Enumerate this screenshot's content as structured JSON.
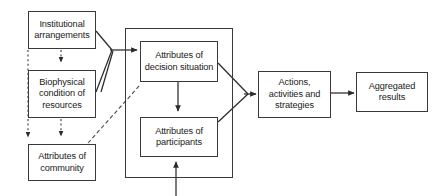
{
  "diagram": {
    "stroke_color": "#3a3a3a",
    "text_color": "#1a1a1a",
    "background": "#ffffff",
    "nodes": {
      "institutional": "Institutional\narrangements",
      "biophysical": "Biophysical\ncondition of\nresources",
      "community": "Attributes of\ncommunity",
      "decision_situation": "Attributes of\ndecision situation",
      "participants": "Attributes of\nparticipants",
      "actions": "Actions,\nactivities and\nstrategies",
      "aggregated": "Aggregated\nresults"
    },
    "edges": [
      {
        "name": "institutional-to-biophysical",
        "style": "dotted",
        "from": "institutional",
        "to": "biophysical"
      },
      {
        "name": "biophysical-to-community",
        "style": "dotted",
        "from": "biophysical",
        "to": "community"
      },
      {
        "name": "institutional-to-community-outer",
        "style": "dotted",
        "from": "institutional",
        "to": "community"
      },
      {
        "name": "institutional-to-arena",
        "style": "solid",
        "from": "institutional",
        "to": "action-arena"
      },
      {
        "name": "biophysical-to-arena",
        "style": "solid",
        "from": "biophysical",
        "to": "action-arena"
      },
      {
        "name": "community-to-decision-situation",
        "style": "dashed",
        "from": "community",
        "to": "decision_situation"
      },
      {
        "name": "decision-situation-to-participants",
        "style": "solid",
        "from": "decision_situation",
        "to": "participants"
      },
      {
        "name": "decision-situation-to-actions",
        "style": "solid",
        "from": "decision_situation",
        "to": "actions"
      },
      {
        "name": "participants-to-actions",
        "style": "solid",
        "from": "participants",
        "to": "actions"
      },
      {
        "name": "actions-to-aggregated",
        "style": "solid",
        "from": "actions",
        "to": "aggregated"
      },
      {
        "name": "external-to-participants",
        "style": "solid",
        "from": "external",
        "to": "participants"
      }
    ]
  }
}
